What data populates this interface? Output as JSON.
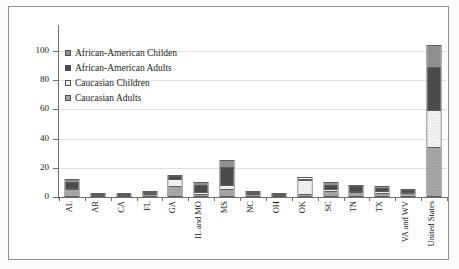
{
  "chart_data": {
    "type": "bar",
    "subtype": "stacked-bar",
    "title": "",
    "xlabel": "",
    "ylabel": "",
    "ylim": [
      0,
      110
    ],
    "yticks": [
      0,
      20,
      40,
      60,
      80,
      100
    ],
    "grid": true,
    "legend_position": "upper-left-inside",
    "categories": [
      "AL",
      "AR",
      "CA",
      "FL",
      "GA",
      "IL and MO",
      "MS",
      "NC",
      "OH",
      "OK",
      "SC",
      "TN",
      "TX",
      "VA and WV",
      "United States"
    ],
    "series": [
      {
        "name": "Caucasian Adults",
        "color": "#b4b4b4",
        "values": [
          4,
          0.5,
          0.5,
          1,
          6,
          1,
          4,
          1.5,
          0.5,
          1,
          3,
          2,
          1.5,
          1.5,
          33
        ]
      },
      {
        "name": "Caucasian Children",
        "color": "#fdfdfd",
        "values": [
          1,
          0.3,
          0.2,
          0.5,
          5,
          1,
          3,
          0.8,
          0.3,
          9,
          1,
          1,
          1,
          1,
          25
        ]
      },
      {
        "name": "African-American Adults",
        "color": "#4a4a4a",
        "values": [
          4,
          0.2,
          0.2,
          0.7,
          2,
          5,
          12,
          0.5,
          0.2,
          1,
          3,
          3,
          2.5,
          1,
          30
        ]
      },
      {
        "name": "African-American Children",
        "color": "#8f8f8f",
        "values": [
          2,
          0.1,
          0.1,
          0.3,
          1,
          2,
          5,
          0.2,
          0.1,
          1,
          2,
          1,
          1,
          0.5,
          15
        ]
      }
    ],
    "totals": [
      11,
      1.1,
      1.0,
      2.5,
      14,
      9,
      24,
      3,
      1.1,
      12,
      9,
      7,
      6,
      4,
      103
    ],
    "legend_entries": [
      "African-American Childen",
      "African-American Adults",
      "Caucasian Children",
      "Caucasian Adults"
    ]
  }
}
